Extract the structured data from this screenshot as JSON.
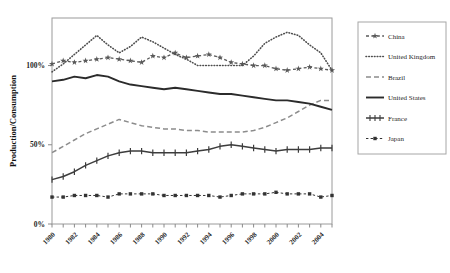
{
  "chart_data": {
    "type": "line",
    "title": "",
    "xlabel": "",
    "ylabel": "Production/Consumption",
    "xlim": [
      1980,
      2005
    ],
    "ylim": [
      0,
      130
    ],
    "grid": false,
    "legend_position": "right",
    "ytick_labels": [
      "0%",
      "50%",
      "100%"
    ],
    "ytick_values": [
      0,
      50,
      100
    ],
    "x": [
      1980,
      1981,
      1982,
      1983,
      1984,
      1985,
      1986,
      1987,
      1988,
      1989,
      1990,
      1991,
      1992,
      1993,
      1994,
      1995,
      1996,
      1997,
      1998,
      1999,
      2000,
      2001,
      2002,
      2003,
      2004,
      2005
    ],
    "xtick_labels": [
      "1980",
      "1982",
      "1984",
      "1986",
      "1988",
      "1990",
      "1992",
      "1994",
      "1996",
      "1998",
      "2000",
      "2002",
      "2004"
    ],
    "xtick_values": [
      1980,
      1982,
      1984,
      1986,
      1988,
      1990,
      1992,
      1994,
      1996,
      1998,
      2000,
      2002,
      2004
    ],
    "series": [
      {
        "name": "China",
        "color": "#595959",
        "style": "dash-marker",
        "marker": "star",
        "values": [
          101,
          103,
          102,
          103,
          104,
          105,
          104,
          103,
          102,
          106,
          105,
          108,
          105,
          106,
          107,
          105,
          102,
          101,
          100,
          100,
          98,
          97,
          98,
          99,
          98,
          97
        ]
      },
      {
        "name": "United Kingdom",
        "color": "#4d4d4d",
        "style": "dotted",
        "marker": "none",
        "values": [
          96,
          101,
          107,
          113,
          119,
          113,
          108,
          112,
          118,
          115,
          111,
          107,
          104,
          100,
          100,
          100,
          100,
          100,
          106,
          114,
          118,
          121,
          119,
          113,
          108,
          97
        ]
      },
      {
        "name": "Brazil",
        "color": "#8c8c8c",
        "style": "dashed",
        "marker": "none",
        "values": [
          45,
          49,
          53,
          57,
          60,
          63,
          66,
          64,
          62,
          61,
          60,
          60,
          59,
          59,
          58,
          58,
          58,
          58,
          59,
          61,
          64,
          67,
          71,
          75,
          78,
          78
        ]
      },
      {
        "name": "United States",
        "color": "#2b2b2b",
        "style": "solid",
        "marker": "none",
        "values": [
          90,
          91,
          93,
          92,
          94,
          93,
          90,
          88,
          87,
          86,
          85,
          86,
          85,
          84,
          83,
          82,
          82,
          81,
          80,
          79,
          78,
          78,
          77,
          76,
          74,
          72
        ]
      },
      {
        "name": "France",
        "color": "#3d3d3d",
        "style": "solid-tick",
        "marker": "tick",
        "values": [
          28,
          30,
          33,
          37,
          40,
          43,
          45,
          46,
          46,
          45,
          45,
          45,
          45,
          46,
          47,
          49,
          50,
          49,
          48,
          47,
          46,
          47,
          47,
          47,
          48,
          48
        ]
      },
      {
        "name": "Japan",
        "color": "#333333",
        "style": "dash-square",
        "marker": "square",
        "values": [
          17,
          17,
          18,
          18,
          18,
          17,
          19,
          19,
          19,
          19,
          18,
          18,
          18,
          18,
          18,
          17,
          18,
          19,
          19,
          19,
          20,
          19,
          19,
          19,
          17,
          18
        ]
      }
    ]
  },
  "legend": {
    "items": [
      {
        "label": "China"
      },
      {
        "label": "United Kingdom"
      },
      {
        "label": "Brazil"
      },
      {
        "label": "United States"
      },
      {
        "label": "France"
      },
      {
        "label": "Japan"
      }
    ]
  }
}
